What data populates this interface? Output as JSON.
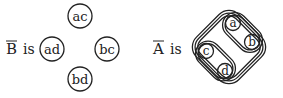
{
  "left": {
    "symbol": "B",
    "connector": "is",
    "nodes": [
      {
        "label": "ac",
        "cx": 80,
        "cy": 16
      },
      {
        "label": "ad",
        "cx": 52,
        "cy": 49
      },
      {
        "label": "bc",
        "cx": 107,
        "cy": 49
      },
      {
        "label": "bd",
        "cx": 80,
        "cy": 78
      }
    ]
  },
  "right": {
    "symbol": "A",
    "connector": "is",
    "nodes": [
      {
        "label": "a",
        "cx": 233,
        "cy": 23
      },
      {
        "label": "b",
        "cx": 252,
        "cy": 42
      },
      {
        "label": "c",
        "cx": 206,
        "cy": 51
      },
      {
        "label": "d",
        "cx": 225,
        "cy": 71
      }
    ]
  },
  "colors": {
    "ink": "#222222",
    "background": "#ffffff"
  }
}
